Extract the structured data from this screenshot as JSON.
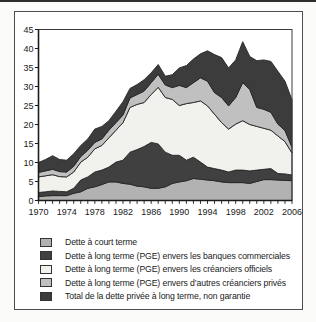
{
  "chart_data": {
    "type": "area",
    "stacked": true,
    "title": "",
    "xlabel": "",
    "ylabel": "",
    "grid": false,
    "legend_position": "bottom",
    "x": [
      1970,
      1971,
      1972,
      1973,
      1974,
      1975,
      1976,
      1977,
      1978,
      1979,
      1980,
      1981,
      1982,
      1983,
      1984,
      1985,
      1986,
      1987,
      1988,
      1989,
      1990,
      1991,
      1992,
      1993,
      1994,
      1995,
      1996,
      1997,
      1998,
      1999,
      2000,
      2001,
      2002,
      2003,
      2004,
      2005,
      2006
    ],
    "x_axis": {
      "start_year": 1970,
      "end_year": 2006,
      "tick_every": 1,
      "label_every": 4,
      "tick_labels": [
        "1970",
        "1974",
        "1978",
        "1982",
        "1986",
        "1990",
        "1994",
        "1998",
        "2002",
        "2006"
      ]
    },
    "y_axis": {
      "min": 0,
      "max": 45,
      "ticks": [
        0,
        5,
        10,
        15,
        20,
        25,
        30,
        35,
        40,
        45
      ]
    },
    "series": [
      {
        "name": "Dette à court terme",
        "color": "#b2b2b2",
        "values": [
          1.0,
          1.2,
          1.3,
          1.3,
          1.3,
          1.9,
          2.3,
          3.2,
          3.6,
          4.2,
          4.9,
          4.9,
          4.5,
          4.3,
          3.8,
          3.6,
          3.2,
          3.2,
          3.6,
          4.5,
          4.9,
          5.2,
          5.8,
          5.6,
          5.4,
          5.2,
          4.9,
          4.7,
          4.7,
          4.7,
          4.5,
          5.0,
          5.5,
          5.5,
          5.4,
          5.3,
          5.2
        ]
      },
      {
        "name": "Dette à long terme (PGE) envers les banques commerciales",
        "color": "#404040",
        "values": [
          1.1,
          1.1,
          1.2,
          1.1,
          1.0,
          1.3,
          3.1,
          3.0,
          3.9,
          3.8,
          3.9,
          5.2,
          6.1,
          8.4,
          9.6,
          10.6,
          12.1,
          11.7,
          9.1,
          7.4,
          7.0,
          5.4,
          5.6,
          4.5,
          3.4,
          3.2,
          3.1,
          2.8,
          3.3,
          3.3,
          3.3,
          3.0,
          2.7,
          2.9,
          1.7,
          1.7,
          1.5
        ]
      },
      {
        "name": "Dette à long terme (PGE) envers les créanciers officiels",
        "color": "#f1f1ed",
        "values": [
          4.1,
          4.2,
          4.3,
          3.9,
          3.9,
          4.3,
          4.7,
          5.2,
          6.1,
          6.5,
          7.7,
          8.4,
          9.9,
          11.8,
          11.9,
          11.6,
          12.6,
          14.9,
          14.4,
          14.7,
          13.1,
          14.9,
          14.4,
          16.1,
          16.1,
          14.3,
          12.5,
          11.3,
          12.1,
          13.0,
          12.2,
          11.5,
          10.8,
          10.1,
          9.9,
          8.5,
          5.8
        ]
      },
      {
        "name": "Dette à long terme (PGE) envers d’autres créanciers privés",
        "color": "#c0c0c0",
        "values": [
          1.2,
          1.3,
          1.4,
          1.3,
          1.3,
          1.5,
          1.5,
          1.8,
          1.7,
          1.7,
          2.0,
          2.0,
          2.0,
          2.5,
          2.6,
          3.0,
          3.1,
          3.4,
          3.3,
          3.1,
          5.3,
          4.2,
          5.2,
          6.1,
          6.5,
          5.7,
          6.6,
          6.1,
          7.0,
          10.0,
          9.2,
          5.0,
          5.0,
          4.7,
          3.1,
          2.9,
          1.5
        ]
      },
      {
        "name": "Total de la dette privée à long terme, non garantie",
        "color": "#3c3c3c",
        "values": [
          2.6,
          3.0,
          3.6,
          3.2,
          3.1,
          3.3,
          2.9,
          3.0,
          3.5,
          3.3,
          2.5,
          3.0,
          3.5,
          2.5,
          2.6,
          3.0,
          2.6,
          2.6,
          2.3,
          3.4,
          4.6,
          5.8,
          6.2,
          6.3,
          8.0,
          10.0,
          10.5,
          10.0,
          9.9,
          10.8,
          8.7,
          12.3,
          13.0,
          13.4,
          13.9,
          13.0,
          12.5
        ]
      }
    ],
    "colors": {
      "band_outline": "#262626",
      "axis": "#1c1c1c",
      "plot_border": "#3c3c3c",
      "tick_label": "#1a1a1a"
    }
  },
  "legend": {
    "swatch_border_color": "#333333"
  }
}
